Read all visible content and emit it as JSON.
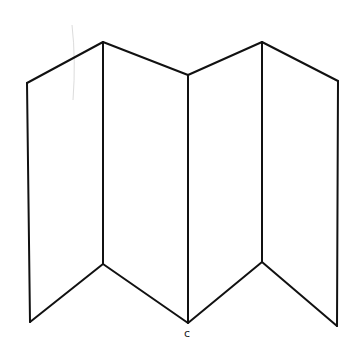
{
  "diagram": {
    "stroke_color": "#111111",
    "background_color": "#ffffff",
    "top_vertices": [
      [
        27,
        83
      ],
      [
        103,
        42
      ],
      [
        188,
        75
      ],
      [
        262,
        42
      ],
      [
        338,
        81
      ]
    ],
    "bottom_vertices": [
      [
        30,
        322
      ],
      [
        103,
        264
      ],
      [
        188,
        323
      ],
      [
        262,
        262
      ],
      [
        337,
        326
      ]
    ],
    "panels": [
      {
        "name": "panel-1",
        "index": 1
      },
      {
        "name": "panel-2",
        "index": 2
      },
      {
        "name": "panel-3",
        "index": 3
      },
      {
        "name": "panel-4",
        "index": 4
      }
    ],
    "labels": [
      {
        "text": "c",
        "x": 185,
        "y": 330
      }
    ]
  }
}
